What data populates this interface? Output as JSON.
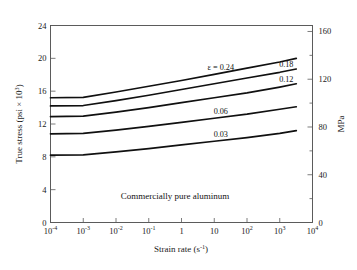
{
  "chart_data": {
    "type": "line",
    "title": "",
    "annotation": "Commercially pure aluminum",
    "xlabel": "Strain rate (s",
    "xlabel_sup": "-1",
    "xlabel_tail": ")",
    "ylabel": "True stress (psi × 10",
    "ylabel_sup": "3",
    "ylabel_tail": ")",
    "ylabel_right": "MPa",
    "xscale": "log",
    "xlim": [
      0.0001,
      10000
    ],
    "ylim": [
      0,
      24
    ],
    "ylim_right": [
      0,
      165
    ],
    "grid": false,
    "legend": "inline-labels",
    "xticks": [
      {
        "value": 0.0001,
        "mantissa": "10",
        "exponent": "-4"
      },
      {
        "value": 0.001,
        "mantissa": "10",
        "exponent": "-3"
      },
      {
        "value": 0.01,
        "mantissa": "10",
        "exponent": "-2"
      },
      {
        "value": 0.1,
        "mantissa": "10",
        "exponent": "-1"
      },
      {
        "value": 1,
        "mantissa": "1",
        "exponent": ""
      },
      {
        "value": 10,
        "mantissa": "10",
        "exponent": ""
      },
      {
        "value": 100,
        "mantissa": "10",
        "exponent": "2"
      },
      {
        "value": 1000,
        "mantissa": "10",
        "exponent": "3"
      },
      {
        "value": 10000,
        "mantissa": "10",
        "exponent": "4"
      }
    ],
    "yticks_left": [
      0,
      4,
      8,
      12,
      16,
      20,
      24
    ],
    "yticks_right": [
      0,
      40,
      80,
      120,
      160
    ],
    "yticks_right_minor": [
      20,
      60,
      100,
      140
    ],
    "series": [
      {
        "name": "ε = 0.24",
        "label": "ε = 0.24",
        "label_epsilon": "ε",
        "label_value": "0.24",
        "strain": 0.24,
        "color": "#101010",
        "x": [
          0.0001,
          0.001,
          0.01,
          0.1,
          1,
          10,
          100,
          1000,
          3200
        ],
        "y": [
          15.2,
          15.25,
          15.9,
          16.6,
          17.3,
          18.05,
          18.8,
          19.55,
          20.0
        ]
      },
      {
        "name": "0.18",
        "label": "0.18",
        "label_value": "0.18",
        "strain": 0.18,
        "color": "#101010",
        "x": [
          0.0001,
          0.001,
          0.01,
          0.1,
          1,
          10,
          100,
          1000,
          3200
        ],
        "y": [
          14.2,
          14.25,
          14.85,
          15.5,
          16.2,
          16.9,
          17.6,
          18.3,
          18.7
        ]
      },
      {
        "name": "0.12",
        "label": "0.12",
        "label_value": "0.12",
        "strain": 0.12,
        "color": "#101010",
        "x": [
          0.0001,
          0.001,
          0.01,
          0.1,
          1,
          10,
          100,
          1000,
          3200
        ],
        "y": [
          12.9,
          12.95,
          13.45,
          14.0,
          14.6,
          15.2,
          15.8,
          16.5,
          16.9
        ]
      },
      {
        "name": "0.06",
        "label": "0.06",
        "label_value": "0.06",
        "strain": 0.06,
        "color": "#101010",
        "x": [
          0.0001,
          0.001,
          0.01,
          0.1,
          1,
          10,
          100,
          1000,
          3200
        ],
        "y": [
          10.8,
          10.85,
          11.25,
          11.7,
          12.2,
          12.7,
          13.2,
          13.8,
          14.1
        ]
      },
      {
        "name": "0.03",
        "label": "0.03",
        "label_value": "0.03",
        "strain": 0.03,
        "color": "#101010",
        "x": [
          0.0001,
          0.001,
          0.01,
          0.1,
          1,
          10,
          100,
          1000,
          3200
        ],
        "y": [
          8.2,
          8.25,
          8.6,
          9.0,
          9.45,
          9.9,
          10.35,
          10.85,
          11.2
        ]
      }
    ]
  }
}
